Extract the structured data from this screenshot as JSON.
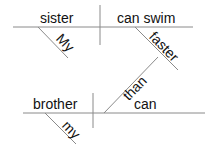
{
  "diagram": {
    "clause_top": {
      "subject": "sister",
      "predicate": "can swim",
      "subject_modifier": "My",
      "predicate_modifier": "faster"
    },
    "connector": "than",
    "clause_bottom": {
      "subject": "brother",
      "predicate": "can",
      "subject_modifier": "my"
    },
    "line_color": "#888888",
    "text_color": "#111111"
  }
}
